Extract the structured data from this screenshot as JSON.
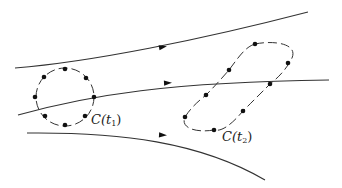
{
  "diagram": {
    "colors": {
      "stroke": "#333333",
      "dot": "#111111",
      "background": "#ffffff"
    },
    "streamlines": [
      {
        "name": "top",
        "path": "M15,68 C90,62 200,40 308,12",
        "arrow": {
          "x": 163,
          "y": 47,
          "angle": -11
        }
      },
      {
        "name": "middle",
        "path": "M18,115 C90,95 170,82 329,80",
        "arrow": {
          "x": 168,
          "y": 83,
          "angle": -3
        }
      },
      {
        "name": "bottom",
        "path": "M27,133 C120,132 200,142 265,180",
        "arrow": {
          "x": 163,
          "y": 135,
          "angle": 3
        }
      }
    ],
    "curves": [
      {
        "name": "C(t1)",
        "shape": "circle",
        "cx": 65,
        "cy": 97,
        "r": 29,
        "dots": [
          [
            65,
            69
          ],
          [
            86,
            78
          ],
          [
            94,
            97
          ],
          [
            85,
            116
          ],
          [
            65,
            125
          ],
          [
            45,
            116
          ],
          [
            35,
            97
          ],
          [
            44,
            77
          ]
        ],
        "label": {
          "name": "C",
          "sub": "1",
          "x": 91,
          "y": 113
        }
      },
      {
        "name": "C(t2)",
        "shape": "tilted-ellipse",
        "path": "M255,44 C275,40 298,44 292,58 C285,72 275,80 270,84 C258,96 250,104 243,111 C232,124 222,132 214,130 C196,133 180,128 185,117 C192,106 200,100 206,95 C215,86 222,78 229,70 C238,58 245,47 255,44 Z",
        "dots": [
          [
            255,
            44
          ],
          [
            288,
            63
          ],
          [
            270,
            84
          ],
          [
            243,
            111
          ],
          [
            214,
            130
          ],
          [
            185,
            117
          ],
          [
            206,
            95
          ],
          [
            229,
            70
          ]
        ],
        "label": {
          "name": "C",
          "sub": "2",
          "x": 222,
          "y": 130
        }
      }
    ]
  },
  "labels": {
    "c_t1_prefix": "C(",
    "c_t1_var": "t",
    "c_t1_sub": "1",
    "c_t1_suffix": ")",
    "c_t2_prefix": "C(",
    "c_t2_var": "t",
    "c_t2_sub": "2",
    "c_t2_suffix": ")"
  }
}
